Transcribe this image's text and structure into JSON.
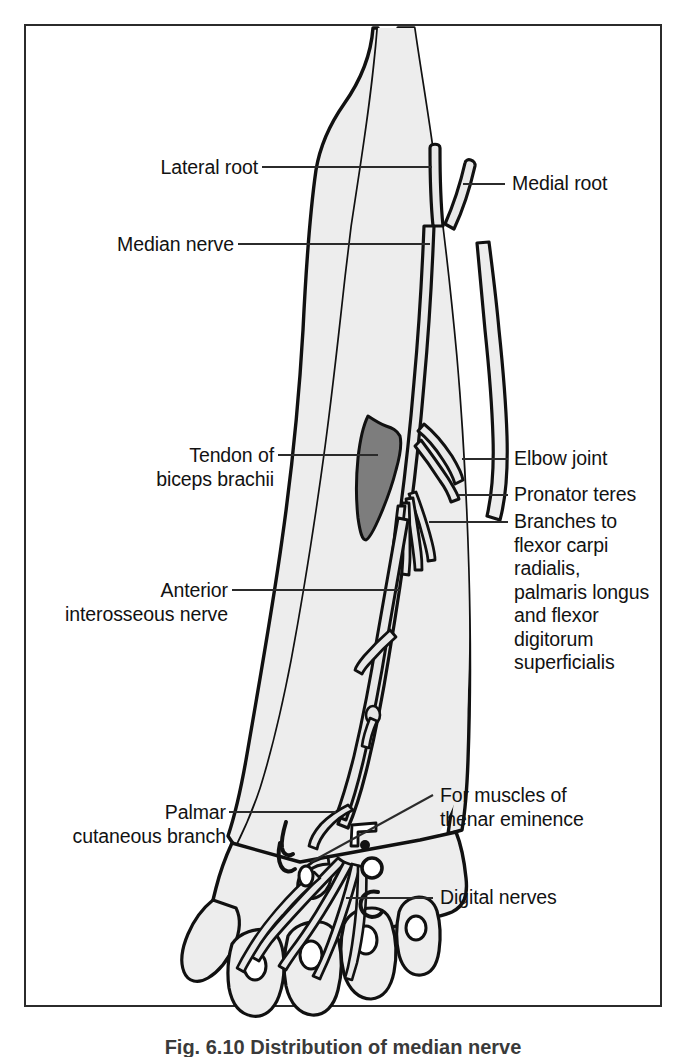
{
  "figure": {
    "caption": "Fig. 6.10  Distribution of median nerve",
    "frame_color": "#2b2b2b",
    "background_color": "#ffffff",
    "limb_fill_color": "#ededed",
    "limb_outline_color": "#111111",
    "nerve_fill_color": "#e8e8e8",
    "nerve_outline_color": "#111111",
    "tendon_fill_color": "#7d7d7d",
    "leader_line_color": "#2b2b2b",
    "text_color": "#121212"
  },
  "labels": {
    "lateral_root": "Lateral root",
    "median_nerve": "Median nerve",
    "medial_root": "Medial root",
    "tendon_biceps": "Tendon of\nbiceps brachii",
    "elbow_joint": "Elbow joint",
    "pronator_teres": "Pronator teres",
    "branches_flexor": "Branches to\nflexor carpi\nradialis,\npalmaris longus\nand flexor\ndigitorum\nsuperficialis",
    "anterior_interosseous": "Anterior\ninterosseous nerve",
    "palmar_cutaneous": "Palmar\ncutaneous branch",
    "thenar_muscles": "For muscles of\nthenar eminence",
    "digital_nerves": "Digital nerves"
  },
  "diagram": {
    "view": "anterior view of right upper limb",
    "structures": [
      "lateral root",
      "medial root",
      "median nerve trunk",
      "tendon of biceps brachii",
      "elbow joint",
      "pronator teres",
      "branches to flexor carpi radialis",
      "branches to palmaris longus",
      "branches to flexor digitorum superficialis",
      "anterior interosseous nerve",
      "palmar cutaneous branch",
      "thenar muscle branch",
      "digital nerves"
    ]
  }
}
